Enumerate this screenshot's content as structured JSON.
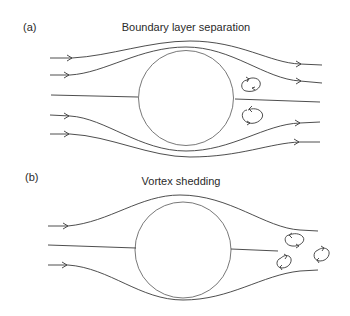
{
  "panels": [
    {
      "label": "(a)",
      "title": "Boundary layer separation",
      "description": "Streamlines around a cylinder with two attached eddies behind it"
    },
    {
      "label": "(b)",
      "title": "Vortex shedding",
      "description": "Streamlines around a cylinder with alternating vortices shed downstream"
    }
  ],
  "colors": {
    "line": "#3a3a3a",
    "background": "#ffffff"
  }
}
